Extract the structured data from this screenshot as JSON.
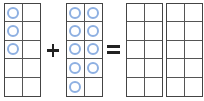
{
  "equation": {
    "operator_plus": "+",
    "operator_equals": "=",
    "frames": [
      {
        "id": "addend-1",
        "left": 4,
        "counters": 3,
        "filled_cells": [
          0,
          2,
          4
        ]
      },
      {
        "id": "addend-2",
        "left": 66,
        "counters": 9,
        "filled_cells": [
          0,
          1,
          2,
          3,
          4,
          5,
          6,
          7,
          8
        ]
      },
      {
        "id": "sum-frame-1",
        "left": 126,
        "counters": 0,
        "filled_cells": []
      },
      {
        "id": "sum-frame-2",
        "left": 166,
        "counters": 0,
        "filled_cells": []
      }
    ]
  },
  "colors": {
    "counter_stroke": "#8eb0e2",
    "grid_line": "#444444",
    "operator": "#222222"
  }
}
